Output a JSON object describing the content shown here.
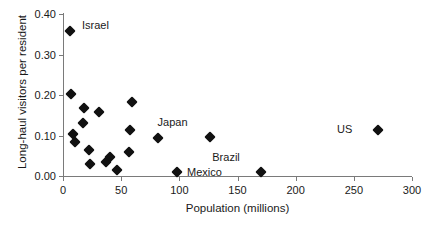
{
  "chart_data": {
    "type": "scatter",
    "title": "",
    "xlabel": "Population (millions)",
    "ylabel": "Long-haul visitors per resident",
    "xlim": [
      0,
      300
    ],
    "ylim": [
      0.0,
      0.4
    ],
    "xticks": [
      "0",
      "50",
      "100",
      "150",
      "200",
      "250",
      "300"
    ],
    "xtick_values": [
      0,
      50,
      100,
      150,
      200,
      250,
      300
    ],
    "yticks": [
      "0.00",
      "0.10",
      "0.20",
      "0.30",
      "0.40"
    ],
    "ytick_values": [
      0.0,
      0.1,
      0.2,
      0.3,
      0.4
    ],
    "grid": false,
    "legend": "none",
    "marker": "diamond",
    "marker_color": "#111111",
    "axis_color": "#7a7a7a",
    "points": [
      {
        "x": 6,
        "y": 0.358,
        "label": "Israel",
        "label_dx": 12,
        "label_dy": -6
      },
      {
        "x": 7,
        "y": 0.203,
        "label": "",
        "label_dx": 0,
        "label_dy": 0
      },
      {
        "x": 9,
        "y": 0.104,
        "label": "",
        "label_dx": 0,
        "label_dy": 0
      },
      {
        "x": 10,
        "y": 0.085,
        "label": "",
        "label_dx": 0,
        "label_dy": 0
      },
      {
        "x": 17,
        "y": 0.131,
        "label": "",
        "label_dx": 0,
        "label_dy": 0
      },
      {
        "x": 18,
        "y": 0.167,
        "label": "",
        "label_dx": 0,
        "label_dy": 0
      },
      {
        "x": 22,
        "y": 0.063,
        "label": "",
        "label_dx": 0,
        "label_dy": 0
      },
      {
        "x": 23,
        "y": 0.029,
        "label": "",
        "label_dx": 0,
        "label_dy": 0
      },
      {
        "x": 31,
        "y": 0.157,
        "label": "",
        "label_dx": 0,
        "label_dy": 0
      },
      {
        "x": 37,
        "y": 0.034,
        "label": "",
        "label_dx": 0,
        "label_dy": 0
      },
      {
        "x": 40,
        "y": 0.046,
        "label": "",
        "label_dx": 0,
        "label_dy": 0
      },
      {
        "x": 46,
        "y": 0.014,
        "label": "",
        "label_dx": 0,
        "label_dy": 0
      },
      {
        "x": 57,
        "y": 0.059,
        "label": "",
        "label_dx": 0,
        "label_dy": 0
      },
      {
        "x": 58,
        "y": 0.114,
        "label": "",
        "label_dx": 0,
        "label_dy": 0
      },
      {
        "x": 59,
        "y": 0.183,
        "label": "",
        "label_dx": 0,
        "label_dy": 0
      },
      {
        "x": 82,
        "y": 0.093,
        "label": "",
        "label_dx": 0,
        "label_dy": 0
      },
      {
        "x": 98,
        "y": 0.011,
        "label": "Mexico",
        "label_dx": 10,
        "label_dy": 0
      },
      {
        "x": 126,
        "y": 0.096,
        "label": "Japan",
        "label_dx": -22,
        "label_dy": -15
      },
      {
        "x": 170,
        "y": 0.011,
        "label": "Brazil",
        "label_dx": -21,
        "label_dy": -15
      },
      {
        "x": 271,
        "y": 0.113,
        "label": "US",
        "label_dx": -26,
        "label_dy": -1
      }
    ]
  }
}
